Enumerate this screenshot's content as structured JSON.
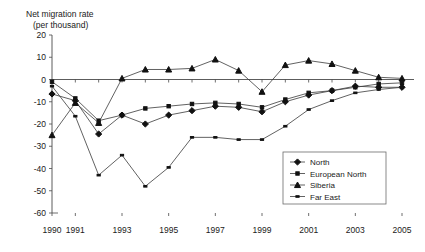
{
  "chart": {
    "type": "line",
    "title_line1": "Net migration rate",
    "title_line2": "(per thousand)",
    "xlabel": "",
    "ylabel": "",
    "ylim": [
      -60,
      20
    ],
    "xlim": [
      1990,
      2005
    ],
    "ytick_labels": [
      "20",
      "10",
      "0",
      "-10",
      "-20",
      "-30",
      "-40",
      "-50",
      "-60"
    ],
    "ytick_values": [
      20,
      10,
      0,
      -10,
      -20,
      -30,
      -40,
      -50,
      -60
    ],
    "xtick_labels": [
      "1990",
      "1991",
      "1993",
      "1995",
      "1997",
      "1999",
      "2001",
      "2003",
      "2005"
    ],
    "xtick_values": [
      1990,
      1991,
      1993,
      1995,
      1997,
      1999,
      2001,
      2003,
      2005
    ],
    "grid": false,
    "legend_position": "bottom-right",
    "zero_line": true
  },
  "chart_data": {
    "type": "line",
    "xlabel": "",
    "ylabel": "Net migration rate (per thousand)",
    "ylim": [
      -60,
      20
    ],
    "xlim": [
      1990,
      2005
    ],
    "grid": false,
    "legend_position": "bottom-right",
    "x": [
      1990,
      1991,
      1992,
      1993,
      1994,
      1995,
      1996,
      1997,
      1998,
      1999,
      2000,
      2001,
      2002,
      2003,
      2004,
      2005
    ],
    "series": [
      {
        "name": "North",
        "marker": "diamond",
        "values": [
          -6.5,
          -9.5,
          -24.5,
          -16.0,
          -20.0,
          -16.0,
          -14.0,
          -12.0,
          -12.5,
          -14.5,
          -10.0,
          -7.0,
          -5.0,
          -3.0,
          -3.5,
          -3.5
        ]
      },
      {
        "name": "European North",
        "marker": "small-square",
        "values": [
          -1.0,
          -8.5,
          -18.5,
          -16.0,
          -13.0,
          -12.0,
          -11.0,
          -10.5,
          -11.0,
          -12.5,
          -9.0,
          -6.0,
          -5.0,
          -3.5,
          -2.0,
          -1.5
        ]
      },
      {
        "name": "Siberia",
        "marker": "triangle",
        "values": [
          -25.0,
          -10.5,
          -19.5,
          0.5,
          4.5,
          4.5,
          5.0,
          9.0,
          4.0,
          -5.5,
          6.5,
          8.5,
          7.0,
          4.0,
          1.0,
          0.5
        ]
      },
      {
        "name": "Far East",
        "marker": "dash",
        "values": [
          -3.0,
          -16.5,
          -43.0,
          -34.0,
          -48.0,
          -39.5,
          -26.0,
          -26.0,
          -27.0,
          -27.0,
          -21.0,
          -13.5,
          -9.5,
          -6.0,
          -4.5,
          -3.5
        ]
      }
    ]
  },
  "legend": {
    "items": [
      {
        "label": "North",
        "marker": "diamond"
      },
      {
        "label": "European North",
        "marker": "small-square"
      },
      {
        "label": "Siberia",
        "marker": "triangle"
      },
      {
        "label": "Far East",
        "marker": "dash"
      }
    ]
  }
}
